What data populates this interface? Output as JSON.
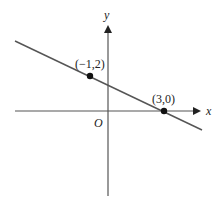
{
  "diagram": {
    "type": "coordinate-plane-line",
    "axes": {
      "x_label": "x",
      "y_label": "y",
      "origin_label": "O"
    },
    "points": [
      {
        "label": "(−1,2)",
        "x": -1,
        "y": 2
      },
      {
        "label": "(3,0)",
        "x": 3,
        "y": 0
      }
    ],
    "line": {
      "slope": -0.5,
      "y_intercept": 1.5
    },
    "colors": {
      "axis": "#555555",
      "line": "#555555",
      "point": "#111111",
      "text": "#222222"
    }
  }
}
